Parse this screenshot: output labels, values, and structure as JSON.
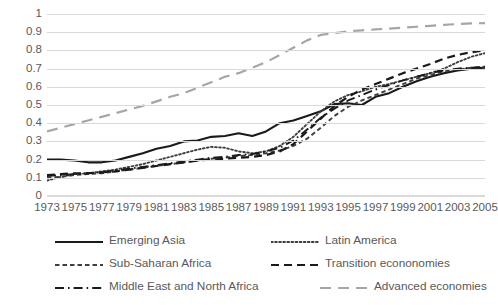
{
  "chart_data": {
    "type": "line",
    "title": "",
    "subtitle": "",
    "xlabel": "",
    "ylabel": "",
    "grid": true,
    "legend_position": "bottom",
    "ylim": [
      0,
      1
    ],
    "ytick_labels": [
      "1",
      "0.9",
      "0.8",
      "0.7",
      "0.6",
      "0.5",
      "0.4",
      "0.3",
      "0.2",
      "0.1",
      "0"
    ],
    "ytick_values": [
      1,
      0.9,
      0.8,
      0.7,
      0.6,
      0.5,
      0.4,
      0.3,
      0.2,
      0.1,
      0
    ],
    "x": [
      1973,
      1974,
      1975,
      1976,
      1977,
      1978,
      1979,
      1980,
      1981,
      1982,
      1983,
      1984,
      1985,
      1986,
      1987,
      1988,
      1989,
      1990,
      1991,
      1992,
      1993,
      1994,
      1995,
      1996,
      1997,
      1998,
      1999,
      2000,
      2001,
      2002,
      2003,
      2004,
      2005
    ],
    "xtick_labels": [
      "1973",
      "1975",
      "1977",
      "1979",
      "1981",
      "1983",
      "1985",
      "1987",
      "1989",
      "1991",
      "1993",
      "1995",
      "1997",
      "1999",
      "2001",
      "2003",
      "2005"
    ],
    "xtick_values": [
      1973,
      1975,
      1977,
      1979,
      1981,
      1983,
      1985,
      1987,
      1989,
      1991,
      1993,
      1995,
      1997,
      1999,
      2001,
      2003,
      2005
    ],
    "series": [
      {
        "name": "Emerging Asia",
        "color": "#1a1a1a",
        "dash": "solid",
        "width": 2.1,
        "values": [
          0.2,
          0.2,
          0.195,
          0.185,
          0.185,
          0.195,
          0.215,
          0.235,
          0.26,
          0.275,
          0.3,
          0.305,
          0.325,
          0.33,
          0.345,
          0.33,
          0.355,
          0.4,
          0.415,
          0.44,
          0.465,
          0.505,
          0.51,
          0.5,
          0.545,
          0.565,
          0.6,
          0.63,
          0.655,
          0.675,
          0.69,
          0.7,
          0.705
        ]
      },
      {
        "name": "Latin America",
        "color": "#3f3f3f",
        "dash": "dotted",
        "width": 1.9,
        "values": [
          0.085,
          0.105,
          0.12,
          0.125,
          0.135,
          0.145,
          0.16,
          0.175,
          0.195,
          0.215,
          0.235,
          0.255,
          0.27,
          0.265,
          0.245,
          0.235,
          0.245,
          0.275,
          0.325,
          0.395,
          0.465,
          0.52,
          0.555,
          0.575,
          0.6,
          0.615,
          0.635,
          0.655,
          0.675,
          0.7,
          0.735,
          0.765,
          0.785
        ]
      },
      {
        "name": "Sub-Saharan Africa",
        "color": "#3f3f3f",
        "dash": "dash-short",
        "width": 1.9,
        "values": [
          0.1,
          0.105,
          0.115,
          0.12,
          0.125,
          0.135,
          0.145,
          0.155,
          0.165,
          0.175,
          0.185,
          0.195,
          0.205,
          0.21,
          0.22,
          0.225,
          0.235,
          0.25,
          0.275,
          0.315,
          0.375,
          0.44,
          0.49,
          0.525,
          0.555,
          0.585,
          0.615,
          0.645,
          0.665,
          0.685,
          0.695,
          0.705,
          0.71
        ]
      },
      {
        "name": "Transition econonomies",
        "color": "#1a1a1a",
        "dash": "dash-long",
        "width": 2.2,
        "values": [
          0.115,
          0.12,
          0.125,
          0.125,
          0.13,
          0.135,
          0.145,
          0.155,
          0.165,
          0.175,
          0.185,
          0.195,
          0.2,
          0.205,
          0.21,
          0.215,
          0.225,
          0.245,
          0.285,
          0.355,
          0.425,
          0.495,
          0.545,
          0.585,
          0.615,
          0.645,
          0.675,
          0.7,
          0.725,
          0.755,
          0.775,
          0.79,
          0.8
        ]
      },
      {
        "name": "Middle East and North Africa",
        "color": "#1a1a1a",
        "dash": "dash-dot",
        "width": 1.9,
        "values": [
          0.11,
          0.115,
          0.12,
          0.125,
          0.13,
          0.14,
          0.15,
          0.16,
          0.17,
          0.18,
          0.19,
          0.2,
          0.21,
          0.215,
          0.225,
          0.23,
          0.245,
          0.265,
          0.305,
          0.365,
          0.43,
          0.48,
          0.525,
          0.555,
          0.585,
          0.61,
          0.635,
          0.655,
          0.675,
          0.69,
          0.7,
          0.705,
          0.71
        ]
      },
      {
        "name": "Advanced economies",
        "color": "#a6a6a6",
        "dash": "dash-xlong",
        "width": 2.2,
        "values": [
          0.355,
          0.375,
          0.395,
          0.415,
          0.435,
          0.455,
          0.475,
          0.495,
          0.52,
          0.545,
          0.565,
          0.595,
          0.625,
          0.655,
          0.675,
          0.705,
          0.735,
          0.775,
          0.815,
          0.855,
          0.885,
          0.895,
          0.905,
          0.91,
          0.915,
          0.92,
          0.925,
          0.93,
          0.935,
          0.94,
          0.945,
          0.948,
          0.95
        ]
      }
    ]
  },
  "legend": {
    "rows": [
      {
        "left": {
          "name": "Emerging Asia"
        },
        "right": {
          "name": "Latin America"
        }
      },
      {
        "left": {
          "name": "Sub-Saharan Africa"
        },
        "right": {
          "name": "Transition econonomies"
        }
      },
      {
        "left": {
          "name": "Middle East and North Africa"
        },
        "right": {
          "name": "Advanced economies"
        }
      }
    ]
  }
}
